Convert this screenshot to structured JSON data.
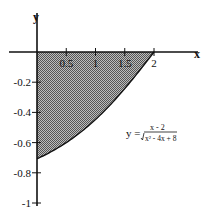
{
  "chart_data": {
    "type": "area",
    "title": "",
    "xlabel": "x",
    "ylabel": "y",
    "function": "y = (x - 2) / sqrt(x^2 - 4x + 8)",
    "formula_display": {
      "lhs": "y =",
      "numerator": "x - 2",
      "denominator": "x² - 4x + 8"
    },
    "xlim": [
      -0.6,
      2.6
    ],
    "ylim": [
      -1.05,
      0.17
    ],
    "x_ticks": [
      0.5,
      1,
      1.5,
      2
    ],
    "x_tick_labels": [
      "0.5",
      "1",
      "1.5",
      "2"
    ],
    "y_ticks": [
      -0.2,
      -0.4,
      -0.6,
      -0.8,
      -1
    ],
    "y_tick_labels": [
      "-0.2",
      "-0.4",
      "-0.6",
      "-0.8",
      "-1"
    ],
    "shaded_region": {
      "x_from": 0,
      "x_to": 2,
      "between": "curve and x-axis"
    },
    "curve_points": [
      {
        "x": 0,
        "y": -0.707
      },
      {
        "x": 0.25,
        "y": -0.658
      },
      {
        "x": 0.5,
        "y": -0.6
      },
      {
        "x": 0.75,
        "y": -0.53
      },
      {
        "x": 1,
        "y": -0.447
      },
      {
        "x": 1.25,
        "y": -0.351
      },
      {
        "x": 1.5,
        "y": -0.243
      },
      {
        "x": 1.75,
        "y": -0.124
      },
      {
        "x": 2,
        "y": 0
      }
    ],
    "grid": false,
    "colors": {
      "fill": "#9a9a9a",
      "line": "#111111"
    }
  }
}
